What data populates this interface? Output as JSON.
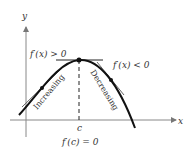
{
  "diagram": {
    "axes": {
      "x_label": "x",
      "y_label": "y"
    },
    "labels": {
      "left_derivative": "f′(x) > 0",
      "right_derivative": "f′(x) < 0",
      "critical_derivative": "f′(c) = 0",
      "critical_point": "c",
      "increasing": "Increasing",
      "decreasing": "Decreasing"
    },
    "colors": {
      "curve": "#111111",
      "axis": "#666666",
      "text": "#333333"
    }
  }
}
